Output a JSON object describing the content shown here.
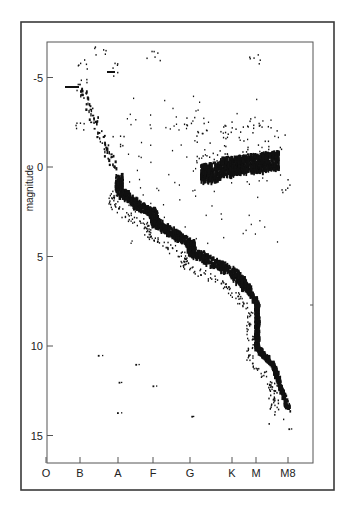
{
  "chart_data": {
    "type": "scatter",
    "title": "",
    "xlabel": "",
    "ylabel": "magnitude",
    "x_tick_labels": [
      "O",
      "B",
      "A",
      "F",
      "G",
      "K",
      "M",
      "M8"
    ],
    "y_ticks": [
      -5,
      0,
      5,
      10,
      15
    ],
    "ylim": [
      16.5,
      -6.8
    ],
    "y_inverted": true,
    "grid": false,
    "legend": null,
    "series": [
      {
        "name": "main sequence (dense band)",
        "points": [
          {
            "x": "A",
            "y": 0.5
          },
          {
            "x": "A",
            "y": 1.2
          },
          {
            "x": "A/F",
            "y": 2.0
          },
          {
            "x": "F",
            "y": 2.5
          },
          {
            "x": "F",
            "y": 3.0
          },
          {
            "x": "F/G",
            "y": 3.6
          },
          {
            "x": "G",
            "y": 4.2
          },
          {
            "x": "G",
            "y": 4.6
          },
          {
            "x": "G/K",
            "y": 5.2
          },
          {
            "x": "K",
            "y": 5.8
          },
          {
            "x": "K/M",
            "y": 6.5
          },
          {
            "x": "M",
            "y": 7.5
          },
          {
            "x": "M",
            "y": 8.8
          },
          {
            "x": "M",
            "y": 10.0
          },
          {
            "x": "M/M8",
            "y": 11.0
          },
          {
            "x": "M8",
            "y": 13.5
          }
        ]
      },
      {
        "name": "giant branch (dense clump)",
        "points": [
          {
            "x": "G/K",
            "y": -0.2
          },
          {
            "x": "K",
            "y": 0.0
          },
          {
            "x": "K",
            "y": 0.4
          },
          {
            "x": "K/M",
            "y": 0.2
          },
          {
            "x": "M",
            "y": 0.0
          },
          {
            "x": "M/M8",
            "y": -0.4
          }
        ]
      },
      {
        "name": "subgiants / scattered upper",
        "points": [
          {
            "x": "B",
            "y": -4.6
          },
          {
            "x": "B",
            "y": -5.7
          },
          {
            "x": "B",
            "y": -2.5
          },
          {
            "x": "B/A",
            "y": -6.5
          },
          {
            "x": "A",
            "y": -5.5
          },
          {
            "x": "A",
            "y": -1.5
          },
          {
            "x": "F",
            "y": -6.3
          },
          {
            "x": "G",
            "y": -2.5
          },
          {
            "x": "K",
            "y": -2.0
          },
          {
            "x": "M",
            "y": -6.0
          },
          {
            "x": "M",
            "y": -2.5
          },
          {
            "x": "M8",
            "y": 1.0
          }
        ]
      },
      {
        "name": "white dwarfs / lower scatter",
        "points": [
          {
            "x": "A",
            "y": 12.0
          },
          {
            "x": "A",
            "y": 13.7
          },
          {
            "x": "F",
            "y": 12.2
          },
          {
            "x": "G",
            "y": 13.9
          },
          {
            "x": "B/A",
            "y": 10.5
          },
          {
            "x": "A/F",
            "y": 11.0
          },
          {
            "x": "M8",
            "y": 14.6
          }
        ]
      }
    ]
  },
  "frame": {
    "outer_border_color": "#3a3a3a",
    "inner_border_color": "#555555",
    "point_color": "#111111"
  }
}
